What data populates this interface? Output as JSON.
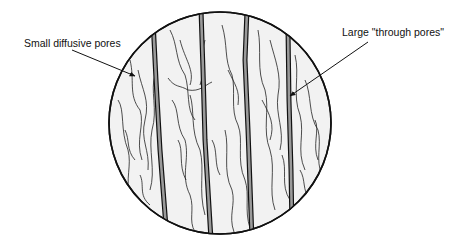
{
  "labels": {
    "small_pores": "Small diffusive pores",
    "large_pores": "Large \"through pores\""
  },
  "colors": {
    "background": "#ffffff",
    "circle_fill": "#f2f2f2",
    "outline": "#111111",
    "through_pore_fill": "#9a9a9a"
  }
}
